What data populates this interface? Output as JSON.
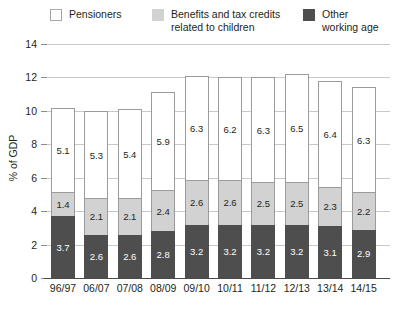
{
  "legend": {
    "items": [
      {
        "label": "Pensioners",
        "key": "pensioners",
        "color": "#ffffff"
      },
      {
        "label": "Benefits and tax credits\nrelated to children",
        "key": "children",
        "color": "#d2d2d2"
      },
      {
        "label": "Other\nworking age",
        "key": "working",
        "color": "#4e4e4e"
      }
    ]
  },
  "axis": {
    "ylabel": "% of GDP",
    "yticks": [
      "0",
      "2",
      "4",
      "6",
      "8",
      "10",
      "12",
      "14"
    ]
  },
  "chart_data": {
    "type": "bar",
    "title": "",
    "subtitle": "",
    "xlabel": "",
    "ylabel": "% of GDP",
    "ylim": [
      0,
      14
    ],
    "ytick_values": [
      0,
      2,
      4,
      6,
      8,
      10,
      12,
      14
    ],
    "grid": true,
    "stacked": true,
    "legend_position": "top",
    "categories": [
      "96/97",
      "06/07",
      "07/08",
      "08/09",
      "09/10",
      "10/11",
      "11/12",
      "12/13",
      "13/14",
      "14/15"
    ],
    "series": [
      {
        "name": "Other working age",
        "color": "#4e4e4e",
        "values": [
          3.7,
          2.6,
          2.6,
          2.8,
          3.2,
          3.2,
          3.2,
          3.2,
          3.1,
          2.9
        ]
      },
      {
        "name": "Benefits and tax credits related to children",
        "color": "#d2d2d2",
        "values": [
          1.4,
          2.1,
          2.1,
          2.4,
          2.6,
          2.6,
          2.5,
          2.5,
          2.3,
          2.2
        ]
      },
      {
        "name": "Pensioners",
        "color": "#ffffff",
        "values": [
          5.1,
          5.3,
          5.4,
          5.9,
          6.3,
          6.2,
          6.3,
          6.5,
          6.4,
          6.3
        ]
      }
    ],
    "totals": [
      10.2,
      10.0,
      10.1,
      11.1,
      12.1,
      12.0,
      12.0,
      12.2,
      11.8,
      11.4
    ]
  }
}
